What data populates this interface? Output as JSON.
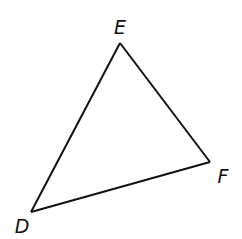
{
  "diagram": {
    "type": "triangle",
    "name": "Triangle DEF",
    "stroke_color": "#111111",
    "background_color": "#ffffff",
    "vertices": [
      {
        "name": "D",
        "x": 31,
        "y": 212,
        "label_x": 22,
        "label_y": 233
      },
      {
        "name": "E",
        "x": 120,
        "y": 43,
        "label_x": 120,
        "label_y": 34
      },
      {
        "name": "F",
        "x": 210,
        "y": 162,
        "label_x": 223,
        "label_y": 183
      }
    ],
    "edges": [
      {
        "name": "DE",
        "from": "D",
        "to": "E"
      },
      {
        "name": "EF",
        "from": "E",
        "to": "F"
      },
      {
        "name": "FD",
        "from": "F",
        "to": "D"
      }
    ],
    "labels": {
      "D": "D",
      "E": "E",
      "F": "F"
    }
  }
}
